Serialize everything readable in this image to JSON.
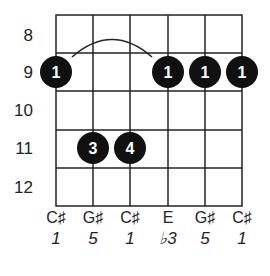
{
  "diagram": {
    "type": "guitar-chord-chart",
    "fret_numbers": [
      "8",
      "9",
      "10",
      "11",
      "12"
    ],
    "strings": 6,
    "frets_shown": 5,
    "barre": {
      "fret": "9",
      "from_string": 1,
      "to_string": 6,
      "finger": "1"
    },
    "dots": [
      {
        "string": 1,
        "fret": "9",
        "finger": "1"
      },
      {
        "string": 2,
        "fret": "11",
        "finger": "3"
      },
      {
        "string": 3,
        "fret": "11",
        "finger": "4"
      },
      {
        "string": 4,
        "fret": "9",
        "finger": "1"
      },
      {
        "string": 5,
        "fret": "9",
        "finger": "1"
      },
      {
        "string": 6,
        "fret": "9",
        "finger": "1"
      }
    ],
    "notes": [
      "C♯",
      "G♯",
      "C♯",
      "E",
      "G♯",
      "C♯"
    ],
    "intervals": [
      "1",
      "5",
      "1",
      "♭3",
      "5",
      "1"
    ],
    "colors": {
      "line": "#222222",
      "dot": "#111111",
      "dot_text": "#ffffff"
    }
  }
}
